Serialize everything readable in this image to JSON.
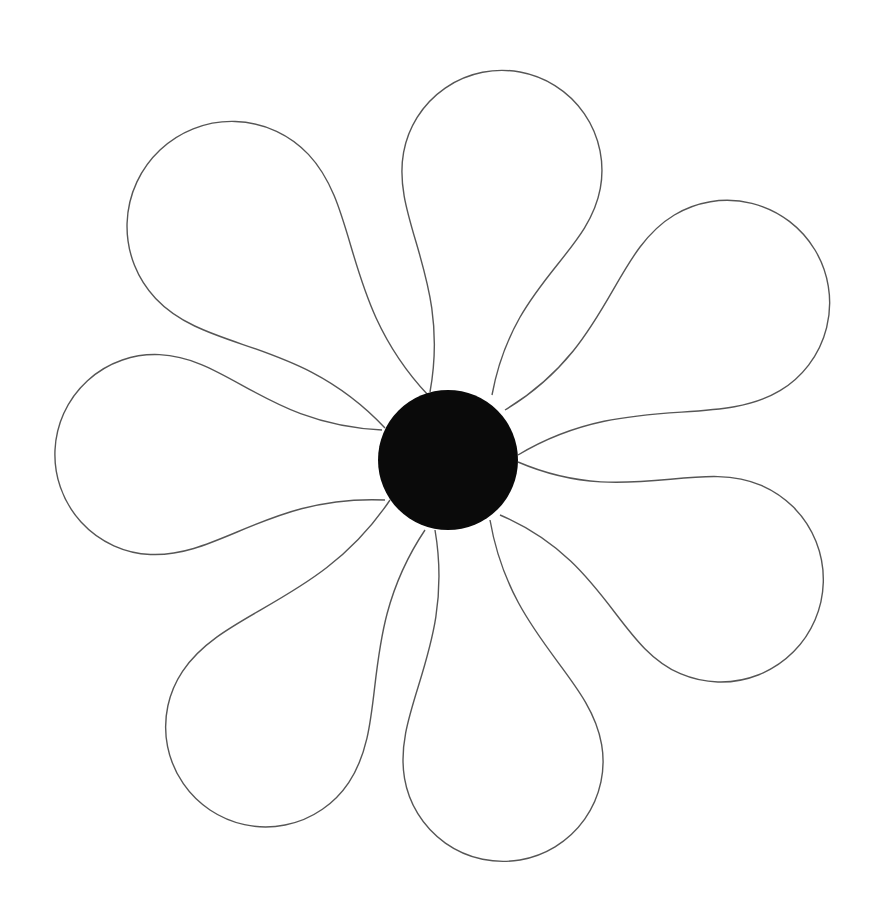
{
  "image": {
    "subject": "flower line art",
    "width": 870,
    "height": 920,
    "background": "#ffffff",
    "center": {
      "cx": 448,
      "cy": 460,
      "r": 70,
      "fill": "#0a0a0a"
    },
    "petal_stroke": "#555555",
    "petal_fill": "#ffffff",
    "petals": [
      {
        "name": "petal-top",
        "base": [
          430,
          392
        ],
        "base2": [
          492,
          395
        ],
        "tipdir": [
          520,
          72
        ],
        "width": 200
      },
      {
        "name": "petal-upper-left",
        "base": [
          428,
          395
        ],
        "base2": [
          385,
          428
        ],
        "tipdir": [
          160,
          150
        ],
        "width": 210
      },
      {
        "name": "petal-upper-right",
        "base": [
          505,
          410
        ],
        "base2": [
          518,
          455
        ],
        "tipdir": [
          815,
          250
        ],
        "width": 205
      },
      {
        "name": "petal-left",
        "base": [
          382,
          430
        ],
        "base2": [
          385,
          500
        ],
        "tipdir": [
          55,
          450
        ],
        "width": 200
      },
      {
        "name": "petal-lower-right",
        "base": [
          518,
          462
        ],
        "base2": [
          500,
          515
        ],
        "tipdir": [
          815,
          620
        ],
        "width": 205
      },
      {
        "name": "petal-lower-left",
        "base": [
          390,
          500
        ],
        "base2": [
          425,
          530
        ],
        "tipdir": [
          210,
          810
        ],
        "width": 200
      },
      {
        "name": "petal-bottom",
        "base": [
          435,
          530
        ],
        "base2": [
          490,
          520
        ],
        "tipdir": [
          520,
          860
        ],
        "width": 200
      }
    ]
  }
}
